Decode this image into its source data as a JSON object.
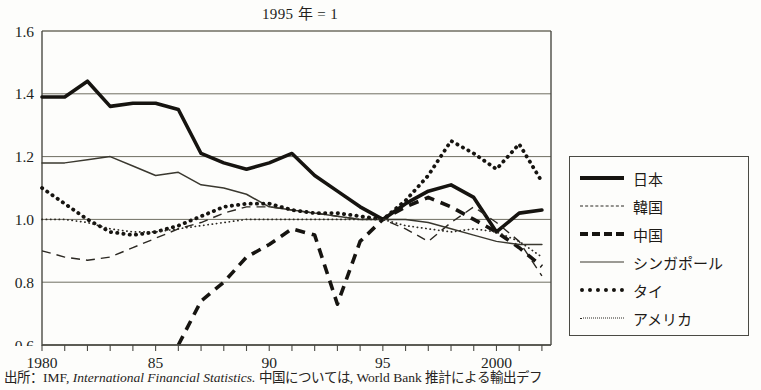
{
  "chart_title": "1995 年 = 1",
  "source_caption": {
    "prefix": "出所：IMF, ",
    "italic": "International Financial Statistics.",
    "suffix": " 中国については, World Bank 推計による輸出デフ"
  },
  "legend": {
    "position": "right",
    "items": [
      {
        "label": "日本",
        "style": "thick-solid",
        "name": "japan"
      },
      {
        "label": "韓国",
        "style": "thin-dashed",
        "name": "korea"
      },
      {
        "label": "中国",
        "style": "thick-dashed",
        "name": "china"
      },
      {
        "label": "シンガポール",
        "style": "thin-solid",
        "name": "singapore"
      },
      {
        "label": "タイ",
        "style": "thick-dotted",
        "name": "thailand"
      },
      {
        "label": "アメリカ",
        "style": "thin-dotted",
        "name": "usa"
      }
    ]
  },
  "chart_data": {
    "type": "line",
    "title": "1995 年 = 1",
    "xlabel": "",
    "ylabel": "",
    "xlim": [
      1980,
      2002.4
    ],
    "ylim": [
      0.6,
      1.6
    ],
    "ytick_labels": [
      "0.6",
      "0.8",
      "1.0",
      "1.2",
      "1.4",
      "1.6"
    ],
    "yticks": [
      0.6,
      0.8,
      1.0,
      1.2,
      1.4,
      1.6
    ],
    "xtick_labels": [
      "1980",
      "85",
      "90",
      "95",
      "2000"
    ],
    "xticks": [
      1980,
      1985,
      1990,
      1995,
      2000
    ],
    "xticks_minor_every": 1,
    "grid": "horizontal",
    "x": [
      1980,
      1981,
      1982,
      1983,
      1984,
      1985,
      1986,
      1987,
      1988,
      1989,
      1990,
      1991,
      1992,
      1993,
      1994,
      1995,
      1996,
      1997,
      1998,
      1999,
      2000,
      2001,
      2002
    ],
    "series": [
      {
        "name": "日本",
        "style": "thick-solid",
        "values": [
          1.39,
          1.39,
          1.44,
          1.36,
          1.37,
          1.37,
          1.35,
          1.21,
          1.18,
          1.16,
          1.18,
          1.21,
          1.14,
          1.09,
          1.04,
          1.0,
          1.05,
          1.09,
          1.11,
          1.07,
          0.96,
          1.02,
          1.03
        ]
      },
      {
        "name": "韓国",
        "style": "thin-dashed",
        "values": [
          0.9,
          0.88,
          0.87,
          0.88,
          0.91,
          0.94,
          0.97,
          0.99,
          1.02,
          1.04,
          1.04,
          1.03,
          1.02,
          1.01,
          1.0,
          1.0,
          0.97,
          0.93,
          0.99,
          1.04,
          0.99,
          0.93,
          0.82
        ]
      },
      {
        "name": "中国",
        "style": "thick-dashed",
        "values": [
          null,
          null,
          null,
          null,
          null,
          null,
          0.6,
          0.74,
          0.8,
          0.88,
          0.92,
          0.97,
          0.95,
          0.73,
          0.93,
          1.0,
          1.04,
          1.07,
          1.04,
          1.0,
          0.96,
          0.91,
          0.85
        ]
      },
      {
        "name": "シンガポール",
        "style": "thin-solid",
        "values": [
          1.18,
          1.18,
          1.19,
          1.2,
          1.17,
          1.14,
          1.15,
          1.11,
          1.1,
          1.08,
          1.04,
          1.03,
          1.02,
          1.01,
          1.0,
          1.0,
          1.0,
          0.99,
          0.97,
          0.95,
          0.93,
          0.92,
          0.92
        ]
      },
      {
        "name": "タイ",
        "style": "thick-dotted",
        "values": [
          1.1,
          1.05,
          1.0,
          0.96,
          0.95,
          0.96,
          0.98,
          1.01,
          1.04,
          1.05,
          1.05,
          1.03,
          1.02,
          1.02,
          1.01,
          1.0,
          1.06,
          1.14,
          1.25,
          1.21,
          1.16,
          1.24,
          1.12
        ]
      },
      {
        "name": "アメリカ",
        "style": "thin-dotted",
        "values": [
          1.0,
          1.0,
          0.99,
          0.97,
          0.96,
          0.96,
          0.97,
          0.98,
          0.99,
          1.0,
          1.0,
          1.0,
          1.0,
          1.0,
          1.0,
          1.0,
          0.98,
          0.97,
          0.96,
          0.97,
          0.96,
          0.93,
          0.88
        ]
      }
    ]
  },
  "colors": {
    "ink": "#161410",
    "grid": "#6f6e62",
    "frame": "#4a4a44",
    "background": "#fdfdfb"
  }
}
